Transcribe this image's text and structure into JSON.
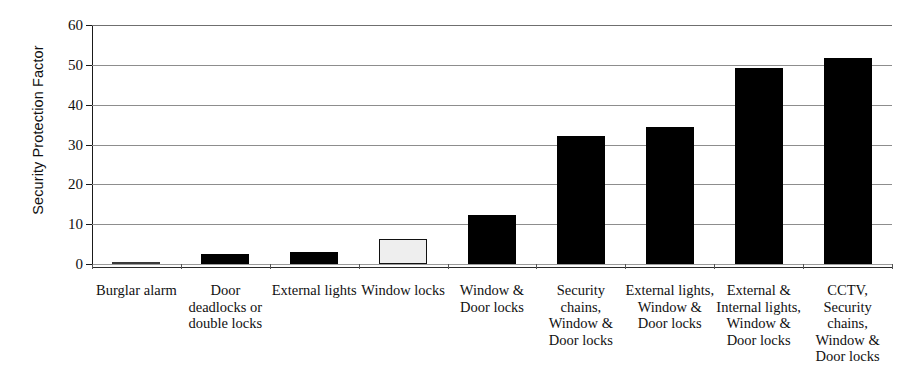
{
  "chart_data": {
    "type": "bar",
    "title": "",
    "subtitle": "",
    "xlabel": "",
    "ylabel": "Security Protection Factor",
    "ylim": [
      0,
      60
    ],
    "ytick_labels": [
      "0",
      "10",
      "20",
      "30",
      "40",
      "50",
      "60"
    ],
    "ytick_values": [
      0,
      10,
      20,
      30,
      40,
      50,
      60
    ],
    "grid": true,
    "legend": "none",
    "categories": [
      "Burglar alarm",
      "Door deadlocks or double locks",
      "External lights",
      "Window locks",
      "Window & Door locks",
      "Security chains, Window & Door locks",
      "External lights, Window & Door locks",
      "External & Internal lights, Window & Door locks",
      "CCTV, Security chains, Window & Door locks"
    ],
    "category_lines": [
      [
        "Burglar alarm"
      ],
      [
        "Door",
        "deadlocks or",
        "double locks"
      ],
      [
        "External lights"
      ],
      [
        "Window locks"
      ],
      [
        "Window &",
        "Door locks"
      ],
      [
        "Security",
        "chains,",
        "Window &",
        "Door locks"
      ],
      [
        "External lights,",
        "Window &",
        "Door locks"
      ],
      [
        "External &",
        "Internal lights,",
        "Window &",
        "Door locks"
      ],
      [
        "CCTV,",
        "Security",
        "chains,",
        "Window &",
        "Door locks"
      ]
    ],
    "values": [
      0.2,
      2.5,
      2.9,
      6.4,
      12.3,
      32.2,
      34.3,
      49.1,
      51.7
    ],
    "bar_styles": [
      "filled",
      "filled",
      "filled",
      "outlined",
      "filled",
      "filled",
      "filled",
      "filled",
      "filled"
    ],
    "colors": {
      "bar_fill": "#000000",
      "bar_outlined_fill": "#eeeeee",
      "bar_outlined_stroke": "#111111",
      "gridline": "#8d8d8d",
      "axis": "#1a1a1a",
      "background": "#ffffff",
      "text": "#111111"
    }
  }
}
